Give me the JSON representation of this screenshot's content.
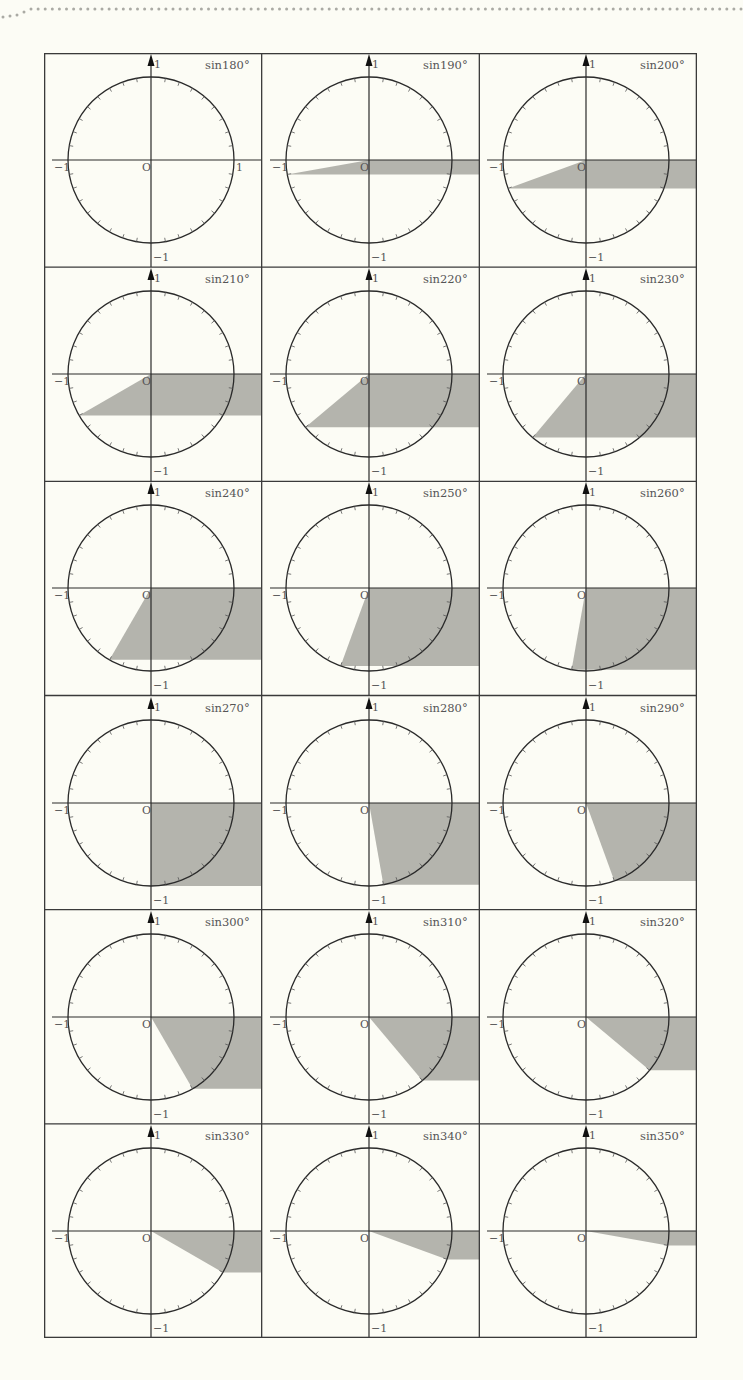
{
  "figure": {
    "axis_labels": {
      "origin": "O",
      "y_top": "1",
      "y_bottom": "−1",
      "x_left": "−1",
      "x_right": "1"
    },
    "colors": {
      "background": "#fcfcf5",
      "line": "#2a2a2a",
      "shade": "#b4b4ad",
      "text": "#555555"
    },
    "cells": [
      {
        "label": "sin180°",
        "angle": 180,
        "show_x_right_label": true
      },
      {
        "label": "sin190°",
        "angle": 190
      },
      {
        "label": "sin200°",
        "angle": 200
      },
      {
        "label": "sin210°",
        "angle": 210
      },
      {
        "label": "sin220°",
        "angle": 220
      },
      {
        "label": "sin230°",
        "angle": 230
      },
      {
        "label": "sin240°",
        "angle": 240
      },
      {
        "label": "sin250°",
        "angle": 250
      },
      {
        "label": "sin260°",
        "angle": 260
      },
      {
        "label": "sin270°",
        "angle": 270
      },
      {
        "label": "sin280°",
        "angle": 280
      },
      {
        "label": "sin290°",
        "angle": 290
      },
      {
        "label": "sin300°",
        "angle": 300
      },
      {
        "label": "sin310°",
        "angle": 310
      },
      {
        "label": "sin320°",
        "angle": 320
      },
      {
        "label": "sin330°",
        "angle": 330
      },
      {
        "label": "sin340°",
        "angle": 340
      },
      {
        "label": "sin350°",
        "angle": 350
      }
    ]
  }
}
